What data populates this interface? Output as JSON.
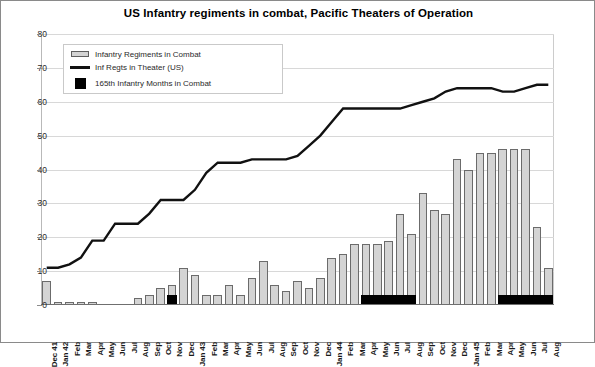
{
  "chart_data": {
    "type": "bar",
    "title": "US Infantry regiments in combat, Pacific Theaters of Operation",
    "xlabel": "",
    "ylabel": "",
    "ylim": [
      0,
      80
    ],
    "yticks": [
      0,
      10,
      20,
      30,
      40,
      50,
      60,
      70,
      80
    ],
    "grid": true,
    "legend_position": "top-left inside plot",
    "categories": [
      "Dec 41",
      "Jan 42",
      "Feb",
      "Mar",
      "Apr",
      "May",
      "Jun",
      "Jul",
      "Aug",
      "Sep",
      "Oct",
      "Nov",
      "Dec",
      "Jan 43",
      "Feb",
      "Mar",
      "Apr",
      "May",
      "Jun",
      "Jul",
      "Aug",
      "Sep",
      "Oct",
      "Nov",
      "Dec",
      "Jan 44",
      "Feb",
      "Mar",
      "Apr",
      "May",
      "Jun",
      "Jul",
      "Aug",
      "Sep",
      "Oct",
      "Nov",
      "Dec",
      "Jan 45",
      "Feb",
      "Mar",
      "Apr",
      "May",
      "Jun",
      "Jul",
      "Aug"
    ],
    "series": [
      {
        "name": "Infantry  Regiments in Combat",
        "type": "bar",
        "color": "#d4d4d4",
        "edge_color": "#6b6b6b",
        "values": [
          7,
          1,
          1,
          1,
          1,
          0,
          0,
          0,
          2,
          3,
          5,
          6,
          11,
          9,
          3,
          3,
          6,
          3,
          8,
          13,
          6,
          4,
          7,
          5,
          8,
          14,
          15,
          18,
          18,
          18,
          19,
          27,
          21,
          33,
          28,
          27,
          43,
          40,
          45,
          45,
          46,
          46,
          46,
          23,
          11
        ]
      },
      {
        "name": "Inf Regts in Theater (US)",
        "type": "line",
        "color": "#111111",
        "values": [
          11,
          11,
          12,
          14,
          19,
          19,
          24,
          24,
          24,
          27,
          31,
          31,
          31,
          34,
          39,
          42,
          42,
          42,
          43,
          43,
          43,
          43,
          44,
          47,
          50,
          54,
          58,
          58,
          58,
          58,
          58,
          58,
          59,
          60,
          61,
          63,
          64,
          64,
          64,
          64,
          63,
          63,
          64,
          65,
          65
        ]
      },
      {
        "name": "165th Infantry Months in Combat",
        "type": "bar",
        "color": "#000000",
        "note": "solid black marker bars indicating months the 165th Infantry was in combat",
        "values": [
          0,
          0,
          0,
          0,
          0,
          0,
          0,
          0,
          0,
          0,
          0,
          1,
          0,
          0,
          0,
          0,
          0,
          0,
          0,
          0,
          0,
          0,
          0,
          0,
          0,
          0,
          0,
          0,
          1,
          1,
          1,
          1,
          1,
          0,
          0,
          0,
          0,
          0,
          0,
          0,
          1,
          1,
          1,
          1,
          1
        ]
      }
    ]
  },
  "legend": {
    "items": [
      {
        "label": "Infantry  Regiments in Combat",
        "key": "gray-bar-swatch-icon"
      },
      {
        "label": "Inf Regts in Theater (US)",
        "key": "black-line-swatch-icon"
      },
      {
        "label": "165th Infantry Months in Combat",
        "key": "black-square-swatch-icon"
      }
    ]
  }
}
